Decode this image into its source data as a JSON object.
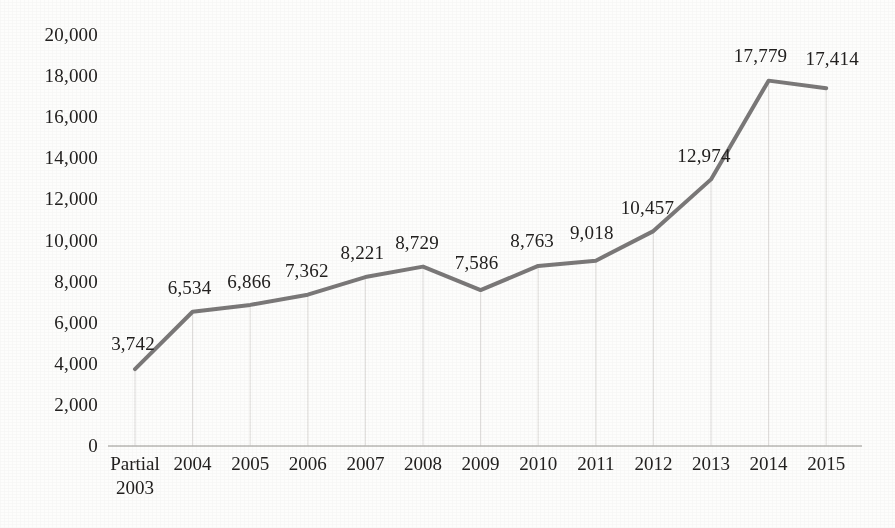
{
  "chart_data": {
    "type": "line",
    "title": "",
    "subtitle": "",
    "xlabel": "",
    "ylabel": "",
    "categories": [
      "Partial 2003",
      "2004",
      "2005",
      "2006",
      "2007",
      "2008",
      "2009",
      "2010",
      "2011",
      "2012",
      "2013",
      "2014",
      "2015"
    ],
    "category_lines": [
      [
        "Partial",
        "2003"
      ],
      [
        "2004"
      ],
      [
        "2005"
      ],
      [
        "2006"
      ],
      [
        "2007"
      ],
      [
        "2008"
      ],
      [
        "2009"
      ],
      [
        "2010"
      ],
      [
        "2011"
      ],
      [
        "2012"
      ],
      [
        "2013"
      ],
      [
        "2014"
      ],
      [
        "2015"
      ]
    ],
    "values": [
      3742,
      6534,
      6866,
      7362,
      8221,
      8729,
      7586,
      8763,
      9018,
      10457,
      12974,
      17779,
      17414
    ],
    "data_labels": [
      "3,742",
      "6,534",
      "6,866",
      "7,362",
      "8,221",
      "8,729",
      "7,586",
      "8,763",
      "9,018",
      "10,457",
      "12,974",
      "17,779",
      "17,414"
    ],
    "ylim": [
      0,
      20000
    ],
    "ytick_values": [
      0,
      2000,
      4000,
      6000,
      8000,
      10000,
      12000,
      14000,
      16000,
      18000,
      20000
    ],
    "ytick_labels": [
      "0",
      "2,000",
      "4,000",
      "6,000",
      "8,000",
      "10,000",
      "12,000",
      "14,000",
      "16,000",
      "18,000",
      "20,000"
    ],
    "grid": "vertical-droplines-only",
    "legend": "none",
    "series": [
      {
        "name": "",
        "values": [
          3742,
          6534,
          6866,
          7362,
          8221,
          8729,
          7586,
          8763,
          9018,
          10457,
          12974,
          17779,
          17414
        ]
      }
    ],
    "colors": {
      "line": "#7a7878",
      "axis": "#b9b7b5",
      "gridline": "#e3e1df",
      "text": "#22201f",
      "background": "#fdfdfc"
    },
    "line_width_px": 4
  }
}
